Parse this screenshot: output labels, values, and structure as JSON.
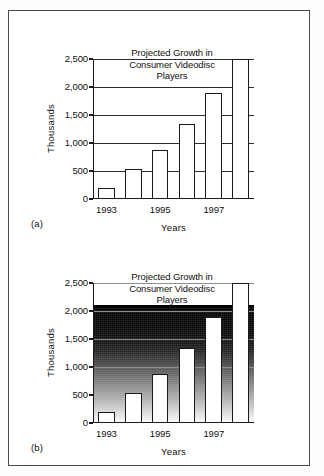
{
  "figure": {
    "panels": [
      {
        "panel_label": "(a)",
        "background_style": "plain-white"
      },
      {
        "panel_label": "(b)",
        "background_style": "gradient-fill"
      }
    ]
  },
  "chart_data": [
    {
      "type": "bar",
      "title": "Projected Growth in Consumer Videodisc Players",
      "title_lines": [
        "Projected Growth in",
        "Consumer Videodisc",
        "Players"
      ],
      "xlabel": "Years",
      "ylabel": "Thousands",
      "categories": [
        "1993",
        "1994",
        "1995",
        "1996",
        "1997",
        "1998"
      ],
      "tick_labels": [
        "1993",
        "",
        "1995",
        "",
        "1997",
        ""
      ],
      "values": [
        200,
        540,
        870,
        1340,
        1900,
        2500
      ],
      "ylim": [
        0,
        2500
      ],
      "yticks": [
        0,
        500,
        1000,
        1500,
        2000,
        2500
      ],
      "ytick_labels": [
        "0",
        "500",
        "1,000",
        "1,500",
        "2,000",
        "2,500"
      ],
      "grid": true,
      "legend": "none",
      "panel": "(a)"
    },
    {
      "type": "bar",
      "title": "Projected Growth in Consumer Videodisc Players",
      "title_lines": [
        "Projected Growth in",
        "Consumer Videodisc",
        "Players"
      ],
      "xlabel": "Years",
      "ylabel": "Thousands",
      "categories": [
        "1993",
        "1994",
        "1995",
        "1996",
        "1997",
        "1998"
      ],
      "tick_labels": [
        "1993",
        "",
        "1995",
        "",
        "1997",
        ""
      ],
      "values": [
        200,
        540,
        870,
        1340,
        1900,
        2500
      ],
      "ylim": [
        0,
        2500
      ],
      "yticks": [
        0,
        500,
        1000,
        1500,
        2000,
        2500
      ],
      "ytick_labels": [
        "0",
        "500",
        "1,000",
        "1,500",
        "2,000",
        "2,500"
      ],
      "grid": true,
      "legend": "none",
      "background_top_value": 2080,
      "panel": "(b)"
    }
  ],
  "colors": {
    "bar_fill": "#ffffff",
    "bar_stroke": "#1a1a1a",
    "axis": "#1a1a1a",
    "gridline": "#2b2b2b",
    "frame": "#4a4a4a",
    "page": "#ffffff",
    "gradient_top": "#000000",
    "gradient_bottom": "#ffffff"
  }
}
